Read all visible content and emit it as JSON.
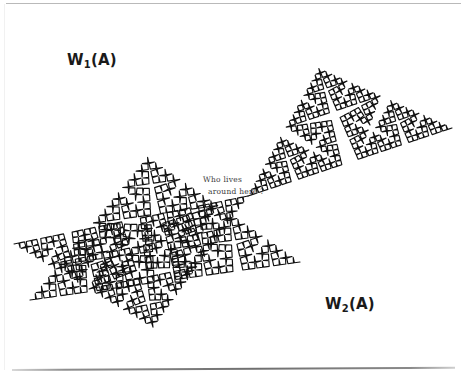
{
  "figure": {
    "type": "fractal-illustration",
    "background_color": "#ffffff",
    "ink_color": "#111111",
    "width": 461,
    "height": 380
  },
  "labels": {
    "w1": {
      "base": "W",
      "sub": "1",
      "suffix": "(A)",
      "text": "W1(A)",
      "x": 67,
      "y": 53
    },
    "w2": {
      "base": "W",
      "sub": "2",
      "suffix": "(A)",
      "text": "W2(A)",
      "x": 325,
      "y": 297
    }
  },
  "annotation": {
    "line1": "Who lives",
    "line2": "around here ?",
    "x": 203,
    "y": 174,
    "color": "#3a3a3a"
  },
  "rules": {
    "top": {
      "x": 6,
      "y": 3,
      "width": 455,
      "color": "#b9b9b9"
    },
    "bottom": {
      "x": 12,
      "y": 369,
      "width": 443,
      "color": "#6f6f6f"
    }
  },
  "chart_data": {
    "type": "line",
    "title": "",
    "generator": {
      "kind": "koch-curve",
      "angle_degrees": 85,
      "iterations": 5,
      "segments_per_step": 4,
      "stroke_width": 1.15
    },
    "copies": [
      {
        "name": "W1(A)",
        "label_position": [
          67,
          53
        ]
      },
      {
        "name": "W2(A)",
        "label_position": [
          325,
          297
        ]
      }
    ],
    "xlabel": "",
    "ylabel": "",
    "grid": false,
    "legend": "none"
  }
}
